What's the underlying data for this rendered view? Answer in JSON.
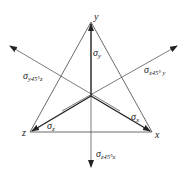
{
  "diagram": {
    "type": "stress-component-triangle",
    "axes": {
      "y": "y",
      "x": "x",
      "z": "z"
    },
    "labels": {
      "sigma_y": {
        "symbol": "σ",
        "sub": "y"
      },
      "sigma_x": {
        "symbol": "σ",
        "sub": "x"
      },
      "sigma_z": {
        "symbol": "σ",
        "sub": "z"
      },
      "sigma_y45z": {
        "symbol": "σ",
        "sub": "y45°z"
      },
      "sigma_x45y": {
        "symbol": "σ",
        "sub": "x45° y"
      },
      "sigma_z45x": {
        "symbol": "σ",
        "sub": "z45°x"
      }
    },
    "colors": {
      "line": "#333333",
      "background": "#ffffff"
    }
  }
}
